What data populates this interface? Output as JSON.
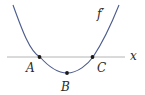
{
  "diagram": {
    "type": "function-graph",
    "curve_label": "f′",
    "axis_label": "x",
    "points": [
      {
        "id": "A",
        "label": "A",
        "description": "x-intercept (left)"
      },
      {
        "id": "B",
        "label": "B",
        "description": "minimum"
      },
      {
        "id": "C",
        "label": "C",
        "description": "x-intercept (right)"
      }
    ],
    "colors": {
      "curve": "#4a5a8c",
      "axis": "#b4b4b4",
      "point": "#1a1a1a",
      "text": "#2a2a2a"
    }
  }
}
